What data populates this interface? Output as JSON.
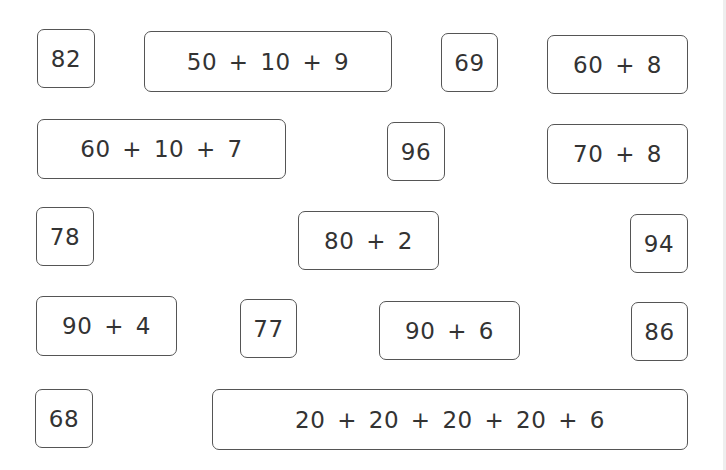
{
  "worksheet": {
    "colors": {
      "background": "#ffffff",
      "border": "#555555",
      "text": "#333333"
    },
    "cards": [
      {
        "id": "c1",
        "kind": "number",
        "text": "82",
        "x": 37,
        "y": 29,
        "w": 58,
        "h": 59
      },
      {
        "id": "c2",
        "kind": "expression",
        "text": "50 + 10 + 9",
        "x": 144,
        "y": 31,
        "w": 248,
        "h": 61
      },
      {
        "id": "c3",
        "kind": "number",
        "text": "69",
        "x": 441,
        "y": 33,
        "w": 57,
        "h": 59
      },
      {
        "id": "c4",
        "kind": "expression",
        "text": "60 + 8",
        "x": 547,
        "y": 35,
        "w": 141,
        "h": 59
      },
      {
        "id": "c5",
        "kind": "expression",
        "text": "60 + 10 + 7",
        "x": 37,
        "y": 119,
        "w": 249,
        "h": 60
      },
      {
        "id": "c6",
        "kind": "number",
        "text": "96",
        "x": 387,
        "y": 122,
        "w": 58,
        "h": 59
      },
      {
        "id": "c7",
        "kind": "expression",
        "text": "70 + 8",
        "x": 547,
        "y": 124,
        "w": 141,
        "h": 60
      },
      {
        "id": "c8",
        "kind": "number",
        "text": "78",
        "x": 36,
        "y": 207,
        "w": 58,
        "h": 59
      },
      {
        "id": "c9",
        "kind": "expression",
        "text": "80 + 2",
        "x": 298,
        "y": 211,
        "w": 141,
        "h": 59
      },
      {
        "id": "c10",
        "kind": "number",
        "text": "94",
        "x": 630,
        "y": 214,
        "w": 58,
        "h": 59
      },
      {
        "id": "c11",
        "kind": "expression",
        "text": "90 + 4",
        "x": 36,
        "y": 296,
        "w": 141,
        "h": 60
      },
      {
        "id": "c12",
        "kind": "number",
        "text": "77",
        "x": 240,
        "y": 299,
        "w": 57,
        "h": 59
      },
      {
        "id": "c13",
        "kind": "expression",
        "text": "90 + 6",
        "x": 379,
        "y": 301,
        "w": 141,
        "h": 59
      },
      {
        "id": "c14",
        "kind": "number",
        "text": "86",
        "x": 631,
        "y": 302,
        "w": 57,
        "h": 59
      },
      {
        "id": "c15",
        "kind": "number",
        "text": "68",
        "x": 35,
        "y": 389,
        "w": 58,
        "h": 59
      },
      {
        "id": "c16",
        "kind": "expression",
        "text": "20 + 20 + 20 + 20 + 6",
        "x": 212,
        "y": 389,
        "w": 476,
        "h": 61
      }
    ]
  }
}
